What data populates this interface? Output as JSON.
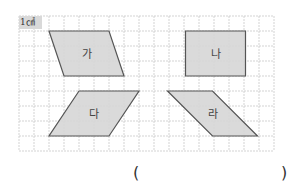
{
  "unit_label": "1㎠",
  "grid": {
    "origin_x": 19,
    "origin_y": 16,
    "cell": 15,
    "cols": 17,
    "rows": 9,
    "line_color": "#c8c8c8"
  },
  "shape_fill": "#d6d6d6",
  "shape_stroke": "#555555",
  "shapes": [
    {
      "label": "가",
      "points": [
        [
          2,
          1
        ],
        [
          6,
          1
        ],
        [
          7,
          4
        ],
        [
          3,
          4
        ]
      ]
    },
    {
      "label": "나",
      "points": [
        [
          11.1,
          1
        ],
        [
          15.1,
          1
        ],
        [
          15.1,
          4
        ],
        [
          11.1,
          4
        ]
      ]
    },
    {
      "label": "다",
      "points": [
        [
          4,
          5
        ],
        [
          8,
          5
        ],
        [
          6,
          8
        ],
        [
          2,
          8
        ]
      ]
    },
    {
      "label": "라",
      "points": [
        [
          9.9,
          5
        ],
        [
          12.9,
          5
        ],
        [
          15.9,
          8
        ],
        [
          12.9,
          8
        ]
      ]
    }
  ],
  "answer": {
    "open": "(",
    "close": ")",
    "value": ""
  }
}
